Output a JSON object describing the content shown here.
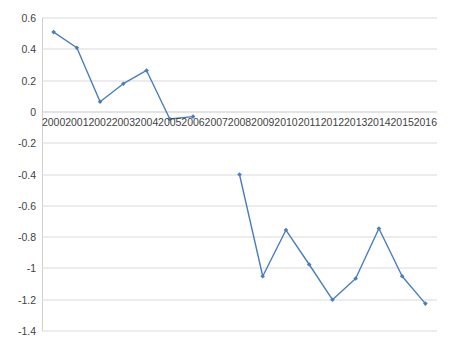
{
  "chart_data": {
    "type": "line",
    "title": "",
    "subtitle": "",
    "xlabel": "",
    "ylabel": "",
    "categories": [
      "2000",
      "2001",
      "2002",
      "2003",
      "2004",
      "2005",
      "2006",
      "2007",
      "2008",
      "2009",
      "2010",
      "2011",
      "2012",
      "2013",
      "2014",
      "2015",
      "2016"
    ],
    "series": [
      {
        "name": "Series 1",
        "color": "#4a7ebb",
        "marker": "diamond",
        "values": [
          0.51,
          0.41,
          0.065,
          0.18,
          0.265,
          -0.045,
          -0.03,
          null,
          -0.4,
          -1.05,
          -0.755,
          -0.975,
          -1.2,
          -1.065,
          -0.745,
          -1.05,
          -1.225
        ]
      }
    ],
    "ylim": [
      -1.4,
      0.6
    ],
    "ytick_step": 0.2,
    "yticks": [
      "0.6",
      "0.4",
      "0.2",
      "0",
      "-0.2",
      "-0.4",
      "-0.6",
      "-0.8",
      "-1",
      "-1.2",
      "-1.4"
    ],
    "ytick_values": [
      0.6,
      0.4,
      0.2,
      0,
      -0.2,
      -0.4,
      -0.6,
      -0.8,
      -1,
      -1.2,
      -1.4
    ],
    "grid": true,
    "grid_axis": "y",
    "legend": false,
    "legend_position": "none",
    "xaxis_at_value": 0,
    "gap_years": [
      "2007"
    ],
    "colors": {
      "line": "#4a7ebb",
      "marker": "#4a7ebb",
      "gridline": "#d9d9d9",
      "axis": "#d0d0d0",
      "text": "#3f3f3f",
      "background": "#ffffff"
    }
  }
}
